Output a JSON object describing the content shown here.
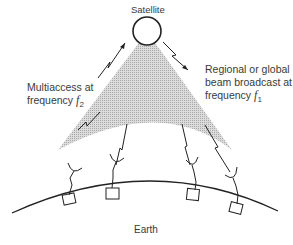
{
  "diagram": {
    "labels": {
      "satellite": "Satellite",
      "earth": "Earth",
      "left_line1": "Multiaccess at",
      "left_line2_prefix": "frequency ",
      "left_freq_symbol": "f",
      "left_freq_sub": "2",
      "right_line1": "Regional or global",
      "right_line2": "beam broadcast at",
      "right_line3_prefix": "frequency ",
      "right_freq_symbol": "f",
      "right_freq_sub": "1"
    },
    "ground_stations": 4,
    "colors": {
      "beam": "#bdbdbd",
      "lines": "#222222",
      "text": "#3a3a3a"
    }
  }
}
